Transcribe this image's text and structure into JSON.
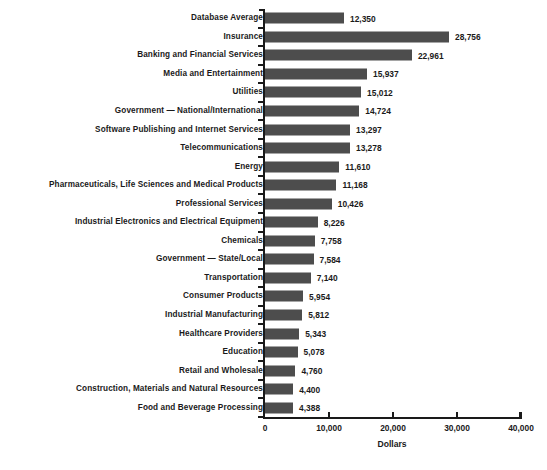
{
  "chart_data": {
    "type": "bar",
    "orientation": "horizontal",
    "title": "",
    "xlabel": "Dollars",
    "ylabel": "",
    "xlim": [
      0,
      40000
    ],
    "xticks": [
      0,
      10000,
      20000,
      30000,
      40000
    ],
    "xtick_labels": [
      "0",
      "10,000",
      "20,000",
      "30,000",
      "40,000"
    ],
    "grid": false,
    "legend": false,
    "bar_color": "#4d4d4d",
    "categories": [
      "Database Average",
      "Insurance",
      "Banking and Financial Services",
      "Media and Entertainment",
      "Utilities",
      "Government — National/International",
      "Software Publishing and Internet Services",
      "Telecommunications",
      "Energy",
      "Pharmaceuticals, Life Sciences and Medical Products",
      "Professional Services",
      "Industrial Electronics and Electrical Equipment",
      "Chemicals",
      "Government — State/Local",
      "Transportation",
      "Consumer Products",
      "Industrial Manufacturing",
      "Healthcare Providers",
      "Education",
      "Retail and Wholesale",
      "Construction, Materials and Natural Resources",
      "Food and Beverage Processing"
    ],
    "values": [
      12350,
      28756,
      22961,
      15937,
      15012,
      14724,
      13297,
      13278,
      11610,
      11168,
      10426,
      8226,
      7758,
      7584,
      7140,
      5954,
      5812,
      5343,
      5078,
      4760,
      4400,
      4388
    ],
    "value_labels": [
      "12,350",
      "28,756",
      "22,961",
      "15,937",
      "15,012",
      "14,724",
      "13,297",
      "13,278",
      "11,610",
      "11,168",
      "10,426",
      "8,226",
      "7,758",
      "7,584",
      "7,140",
      "5,954",
      "5,812",
      "5,343",
      "5,078",
      "4,760",
      "4,400",
      "4,388"
    ]
  }
}
